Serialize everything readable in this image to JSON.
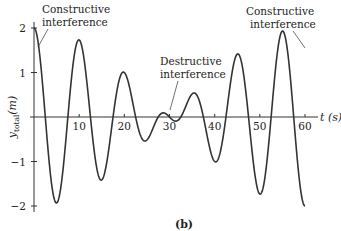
{
  "chart_data": {
    "type": "line",
    "title": "",
    "xlabel": "t (s)",
    "ylabel": "y_total(m)",
    "xlim": [
      0,
      60
    ],
    "ylim": [
      -2,
      2
    ],
    "x_ticks": [
      10,
      20,
      30,
      40,
      50,
      60
    ],
    "y_ticks": [
      2,
      1,
      -1,
      -2
    ],
    "grid": false,
    "legend": "none",
    "caption": "(b)",
    "series": [
      {
        "name": "y_total",
        "formula": "2*cos(2*pi*t/120)*cos(2*pi*t/10)",
        "x": [
          0,
          5,
          10,
          15,
          20,
          25,
          30,
          35,
          40,
          45,
          50,
          55,
          60
        ],
        "values": [
          2.0,
          -1.9,
          1.65,
          -1.3,
          0.8,
          -0.35,
          0.0,
          -0.35,
          0.8,
          -1.3,
          1.65,
          -1.9,
          2.0
        ]
      }
    ],
    "annotations": [
      {
        "text_line1": "Constructive",
        "text_line2": "interference",
        "x": 0,
        "y": 2
      },
      {
        "text_line1": "Destructive",
        "text_line2": "interference",
        "x": 30,
        "y": 0
      },
      {
        "text_line1": "Constructive",
        "text_line2": "interference",
        "x": 60,
        "y": 2
      }
    ]
  },
  "labels": {
    "x_axis": "t (s)",
    "y_axis_main": "y",
    "y_axis_sub": "total",
    "y_axis_unit": "(m)",
    "caption": "(b)",
    "tick_x": [
      "10",
      "20",
      "30",
      "40",
      "50",
      "60"
    ],
    "tick_y": [
      "2",
      "1",
      "−1",
      "−2"
    ],
    "ann_left_1": "Constructive",
    "ann_left_2": "interference",
    "ann_mid_1": "Destructive",
    "ann_mid_2": "interference",
    "ann_right_1": "Constructive",
    "ann_right_2": "interference"
  }
}
